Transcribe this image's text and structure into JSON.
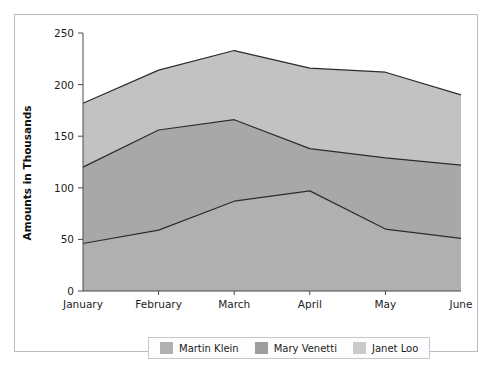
{
  "figure": {
    "background_color": "#ffffff",
    "border_color": "#b9bcc4"
  },
  "chart_data": {
    "type": "area",
    "stacked": true,
    "title": "",
    "subtitle": "",
    "xlabel": "",
    "ylabel": "Amounts in Thousands",
    "categories": [
      "January",
      "February",
      "March",
      "April",
      "May",
      "June"
    ],
    "yticks": [
      0,
      50,
      100,
      150,
      200,
      250
    ],
    "ytick_labels": [
      "0",
      "50",
      "100",
      "150",
      "200",
      "250"
    ],
    "ylim": [
      0,
      250
    ],
    "grid": false,
    "legend_position": "bottom",
    "series": [
      {
        "name": "Martin Klein",
        "color": "#b0b0b0",
        "values": [
          46,
          59,
          87,
          97,
          60,
          51
        ],
        "cumulative": [
          46,
          59,
          87,
          97,
          60,
          51
        ]
      },
      {
        "name": "Mary Venetti",
        "color": "#a8a8a8",
        "values": [
          74,
          97,
          79,
          41,
          69,
          71
        ],
        "cumulative": [
          120,
          156,
          166,
          138,
          129,
          122
        ]
      },
      {
        "name": "Janet Loo",
        "color": "#c2c2c2",
        "values": [
          62,
          58,
          67,
          78,
          83,
          68
        ],
        "cumulative": [
          182,
          214,
          233,
          216,
          212,
          190
        ]
      }
    ],
    "line_color": "#2c2c2c"
  },
  "legend": {
    "entries": [
      {
        "label": "Martin Klein",
        "color": "#b0b0b0"
      },
      {
        "label": "Mary Venetti",
        "color": "#9e9e9e"
      },
      {
        "label": "Janet Loo",
        "color": "#cacaca"
      }
    ]
  },
  "axis": {
    "y_title": "Amounts in Thousands"
  }
}
